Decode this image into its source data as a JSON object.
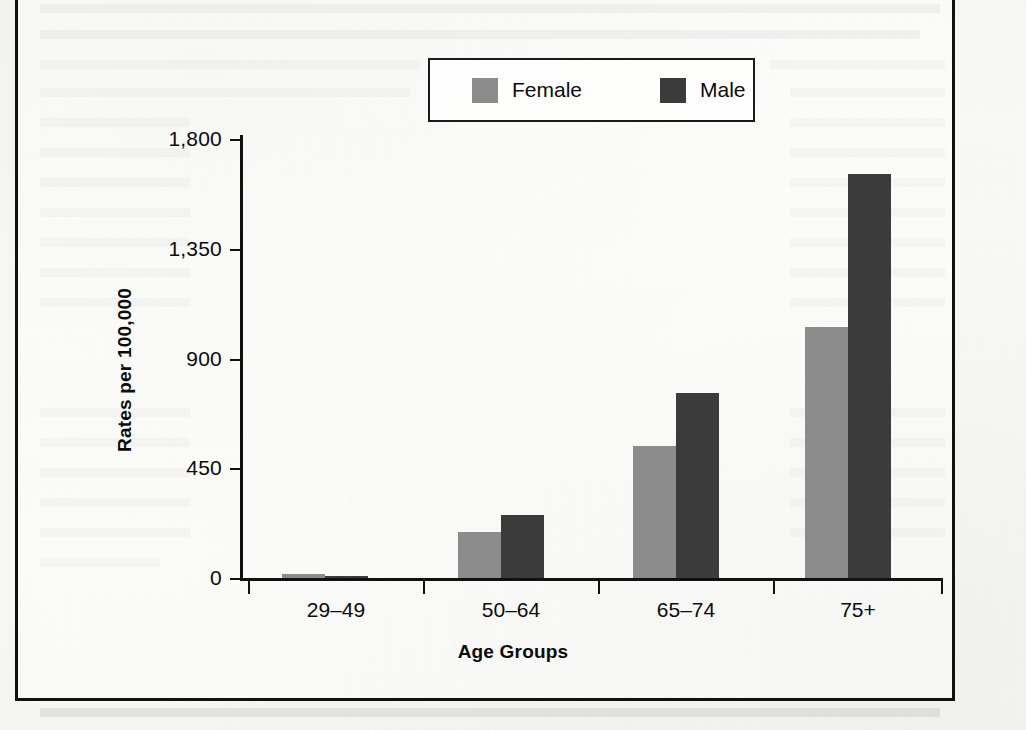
{
  "figure": {
    "background_note": "scanned-book-page",
    "frame_color": "#111111"
  },
  "legend": {
    "position": "top-center",
    "entries": [
      {
        "label": "Female",
        "color": "#8c8c8c",
        "swatch_name": "legend-swatch-female"
      },
      {
        "label": "Male",
        "color": "#3b3b3b",
        "swatch_name": "legend-swatch-male"
      }
    ]
  },
  "axes": {
    "y_title": "Rates per 100,000",
    "x_title": "Age Groups",
    "y_ticks": [
      "0",
      "450",
      "900",
      "1,350",
      "1,800"
    ],
    "x_ticks": [
      "29–49",
      "50–64",
      "65–74",
      "75+"
    ]
  },
  "chart_data": {
    "type": "bar",
    "title": "",
    "xlabel": "Age Groups",
    "ylabel": "Rates per 100,000",
    "categories": [
      "29–49",
      "50–64",
      "65–74",
      "75+"
    ],
    "series": [
      {
        "name": "Female",
        "color": "#8c8c8c",
        "values": [
          15,
          190,
          540,
          1030
        ]
      },
      {
        "name": "Male",
        "color": "#3b3b3b",
        "values": [
          6,
          260,
          760,
          1655
        ]
      }
    ],
    "ylim": [
      0,
      1800
    ],
    "yticks": [
      0,
      450,
      900,
      1350,
      1800
    ],
    "ytick_labels": [
      "0",
      "450",
      "900",
      "1,350",
      "1,800"
    ],
    "grid": false,
    "legend_position": "top-center",
    "bar_grouping": "grouped",
    "note": "Values estimated from pixel heights against the 0–1800 axis"
  }
}
